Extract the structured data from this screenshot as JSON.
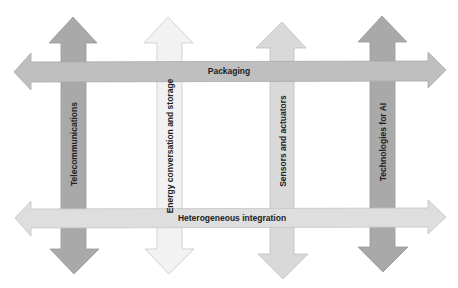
{
  "diagram": {
    "vertical_arrows": [
      {
        "id": "telecom",
        "label": "Telecommunications",
        "fill": "#a9a9a9",
        "stroke": "#999999"
      },
      {
        "id": "energy",
        "label": "Energy conversation and storage",
        "fill": "#f2f2f2",
        "stroke": "#c8c8c8"
      },
      {
        "id": "sensors",
        "label": "Sensors and actuators",
        "fill": "#d9d9d9",
        "stroke": "#bdbdbd"
      },
      {
        "id": "ai",
        "label": "Technologies for AI",
        "fill": "#a9a9a9",
        "stroke": "#999999"
      }
    ],
    "horizontal_arrows": [
      {
        "id": "packaging",
        "label": "Packaging",
        "fill": "#bfbfbf",
        "stroke": "#a8a8a8"
      },
      {
        "id": "hetero",
        "label": "Heterogeneous integration",
        "fill": "#dedede",
        "stroke": "#c4c4c4"
      }
    ]
  }
}
